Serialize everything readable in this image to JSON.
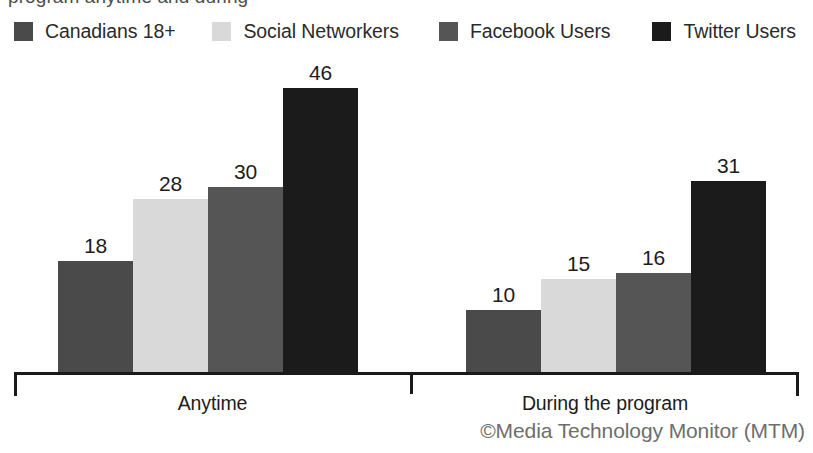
{
  "title_clipped": "program anytime and during",
  "legend": {
    "items": [
      {
        "label": "Canadians 18+",
        "color": "#4a4a4a",
        "icon": "legend-swatch-icon"
      },
      {
        "label": "Social Networkers",
        "color": "#d9d9d9",
        "icon": "legend-swatch-icon"
      },
      {
        "label": "Facebook Users",
        "color": "#555555",
        "icon": "legend-swatch-icon"
      },
      {
        "label": "Twitter Users",
        "color": "#1b1b1b",
        "icon": "legend-swatch-icon"
      }
    ]
  },
  "attribution": "©Media Technology Monitor (MTM)",
  "chart_data": {
    "type": "bar",
    "title": "program anytime and during",
    "xlabel": "",
    "ylabel": "",
    "ylim": [
      0,
      46
    ],
    "grid": false,
    "legend_position": "top",
    "categories": [
      "Anytime",
      "During the program"
    ],
    "series": [
      {
        "name": "Canadians 18+",
        "color": "#4a4a4a",
        "values": [
          18,
          10
        ]
      },
      {
        "name": "Social Networkers",
        "color": "#d9d9d9",
        "values": [
          28,
          15
        ]
      },
      {
        "name": "Facebook Users",
        "color": "#555555",
        "values": [
          30,
          16
        ]
      },
      {
        "name": "Twitter Users",
        "color": "#1b1b1b",
        "values": [
          46,
          31
        ]
      }
    ]
  }
}
